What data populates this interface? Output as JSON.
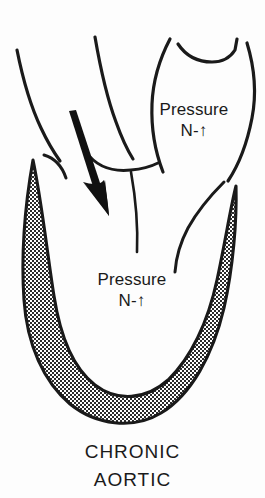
{
  "figure": {
    "kind": "medical-illustration",
    "background_color": "#fdfdfd",
    "ink_color": "#1a1a1a",
    "wall_fill_color": "#808080"
  },
  "labels": {
    "aortic_pressure": {
      "line1": "Pressure",
      "line2": "N-↑"
    },
    "ventricular_pressure": {
      "line1": "Pressure",
      "line2": "N-↑"
    }
  },
  "caption": {
    "line1": "CHRONIC",
    "line2": "AORTIC"
  },
  "annotations": {
    "flow_arrow": "regurgitant-flow-arrow"
  }
}
